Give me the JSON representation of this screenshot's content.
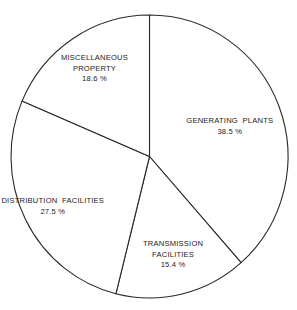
{
  "chart_data": {
    "type": "pie",
    "title": "",
    "start": "12 o'clock",
    "direction": "clockwise",
    "unit": "%",
    "slices": [
      {
        "name": "Generating Plants",
        "label_lines": [
          "GENERATING  PLANTS"
        ],
        "value": 38.5,
        "value_label": "38.5 %"
      },
      {
        "name": "Transmission Facilities",
        "label_lines": [
          "TRANSMISSION",
          "FACILITIES"
        ],
        "value": 15.4,
        "value_label": "15.4 %"
      },
      {
        "name": "Distribution Facilities",
        "label_lines": [
          "DISTRIBUTION  FACILITIES"
        ],
        "value": 27.5,
        "value_label": "27.5 %"
      },
      {
        "name": "Miscellaneous Property",
        "label_lines": [
          "MISCELLANEOUS",
          "PROPERTY"
        ],
        "value": 18.6,
        "value_label": "18.6 %"
      }
    ],
    "colors": {
      "fill": "#ffffff",
      "stroke": "#2a2a2a",
      "text": "#1a1a1a"
    }
  }
}
